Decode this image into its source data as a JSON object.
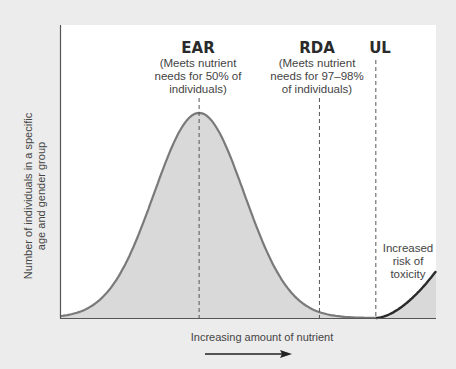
{
  "chart_data": {
    "type": "area",
    "title": "",
    "xlabel": "Increasing amount of nutrient",
    "ylabel": "Number of individuals in a specific age and gender group",
    "ylabel_lines": [
      "Number of individuals in a specific",
      "age and gender group"
    ],
    "xlim": [
      0,
      100
    ],
    "ylim": [
      0,
      100
    ],
    "grid": false,
    "series": [
      {
        "name": "Distribution of nutrient requirements",
        "kind": "bell-curve",
        "mean": 37,
        "sd": 12,
        "peak": 70,
        "fill": "#d9d9d9",
        "stroke": "#7a7a7a"
      },
      {
        "name": "Increased risk of toxicity",
        "kind": "rising-curve",
        "start_x": 84,
        "end_x": 100,
        "end_y": 16,
        "fill": "#d9d9d9",
        "stroke": "#2a2a2a"
      }
    ],
    "reference_lines": [
      {
        "id": "ear",
        "x": 37,
        "label": "EAR",
        "description": [
          "(Meets nutrient",
          "needs for 50% of",
          "individuals)"
        ]
      },
      {
        "id": "rda",
        "x": 69,
        "label": "RDA",
        "description": [
          "(Meets nutrient",
          "needs for 97–98%",
          "of individuals)"
        ]
      },
      {
        "id": "ul",
        "x": 84,
        "label": "UL",
        "description": []
      }
    ],
    "annotations": [
      {
        "id": "toxicity",
        "lines": [
          "Increased",
          "risk of",
          "toxicity"
        ]
      }
    ],
    "arrow": "right"
  },
  "colors": {
    "background": "#ececec",
    "plot_bg": "#ffffff",
    "fill": "#d9d9d9",
    "curve": "#7a7a7a",
    "toxicity_curve": "#2a2a2a",
    "axis": "#555555"
  }
}
